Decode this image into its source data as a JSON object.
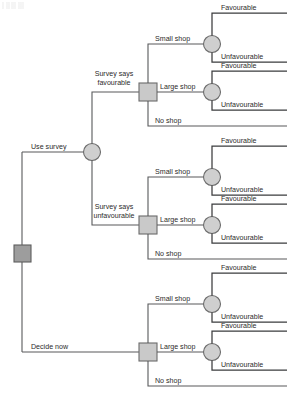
{
  "diagram": {
    "type": "decision-tree",
    "colors": {
      "decision_node_fill": "#c9c9c9",
      "root_node_fill": "#9d9d9d",
      "chance_node_fill": "#cfcfcf",
      "node_stroke": "#6b6b6b",
      "branch_line": "#58595b",
      "terminal_line": "#3b3c3e",
      "background": "#ffffff",
      "text": "#2b2b2b"
    },
    "root": {
      "node_type": "decision",
      "label": ""
    },
    "branches": {
      "use_survey": "Use survey",
      "decide_now": "Decide now",
      "survey_favourable_line1": "Survey says",
      "survey_favourable_line2": "favourable",
      "survey_unfavourable_line1": "Survey says",
      "survey_unfavourable_line2": "unfavourable",
      "small_shop": "Small shop",
      "large_shop": "Large shop",
      "no_shop": "No shop",
      "favourable": "Favourable",
      "unfavourable": "Unfavourable"
    },
    "subtrees": [
      {
        "id": "survey-favourable",
        "parent_branch": "Survey says favourable",
        "options": [
          "Small shop",
          "Large shop",
          "No shop"
        ],
        "outcomes": [
          "Favourable",
          "Unfavourable"
        ]
      },
      {
        "id": "survey-unfavourable",
        "parent_branch": "Survey says unfavourable",
        "options": [
          "Small shop",
          "Large shop",
          "No shop"
        ],
        "outcomes": [
          "Favourable",
          "Unfavourable"
        ]
      },
      {
        "id": "decide-now",
        "parent_branch": "Decide now",
        "options": [
          "Small shop",
          "Large shop",
          "No shop"
        ],
        "outcomes": [
          "Favourable",
          "Unfavourable"
        ]
      }
    ],
    "node_counts": {
      "decision_nodes": 4,
      "chance_nodes": 7,
      "terminal_branches": 9
    }
  }
}
